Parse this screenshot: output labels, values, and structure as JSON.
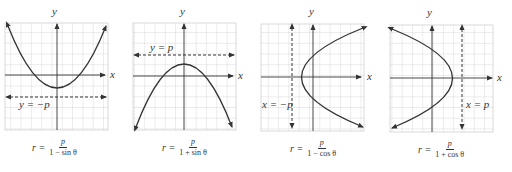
{
  "figure": {
    "colors": {
      "grid": "#cfcfcf",
      "axes": "#333333",
      "curve": "#333333",
      "directrix": "#333333",
      "background": "#ffffff"
    },
    "panels": [
      {
        "id": "p1",
        "axis_x_label": "x",
        "axis_y_label": "y",
        "directrix_label": "y = −p",
        "directrix_orientation": "horizontal",
        "opens": "up",
        "formula": {
          "lhs": "r =",
          "numerator": "p",
          "denominator": "1 − sin θ"
        }
      },
      {
        "id": "p2",
        "axis_x_label": "x",
        "axis_y_label": "y",
        "directrix_label": "y = p",
        "directrix_orientation": "horizontal",
        "opens": "down",
        "formula": {
          "lhs": "r =",
          "numerator": "p",
          "denominator": "1 + sin θ"
        }
      },
      {
        "id": "p3",
        "axis_x_label": "x",
        "axis_y_label": "y",
        "directrix_label": "x = −p",
        "directrix_orientation": "vertical",
        "opens": "right",
        "formula": {
          "lhs": "r =",
          "numerator": "p",
          "denominator": "1 − cos θ"
        }
      },
      {
        "id": "p4",
        "axis_x_label": "x",
        "axis_y_label": "y",
        "directrix_label": "x = p",
        "directrix_orientation": "vertical",
        "opens": "left",
        "formula": {
          "lhs": "r =",
          "numerator": "p",
          "denominator": "1 + cos θ"
        }
      }
    ]
  }
}
